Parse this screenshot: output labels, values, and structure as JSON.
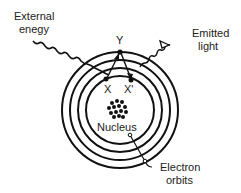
{
  "diagram": {
    "labels": {
      "external_energy_line1": "External",
      "external_energy_line2": "enegy",
      "emitted_light_line1": "Emitted",
      "emitted_light_line2": "light",
      "electron_orbits_line1": "Electron",
      "electron_orbits_line2": "orbits",
      "nucleus": "Nucleus",
      "y": "Y",
      "x": "X",
      "x_prime": "X'"
    },
    "orbit_count": 4,
    "colors": {
      "line": "#111111",
      "background": "#ffffff"
    }
  }
}
